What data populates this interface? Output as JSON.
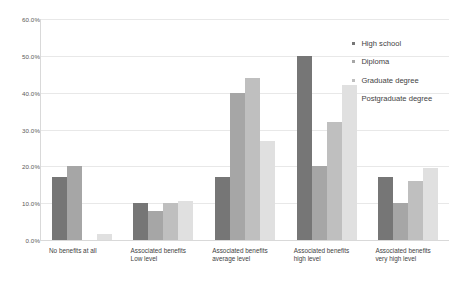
{
  "chart_data": {
    "type": "bar",
    "title": "",
    "xlabel": "",
    "ylabel": "",
    "ylim": [
      0,
      60
    ],
    "grid": true,
    "legend_position": "right",
    "ytick_labels": [
      "60.0%",
      "50.0%",
      "40.0%",
      "30.0%",
      "20.0%",
      "10.0%",
      "0.0%"
    ],
    "ytick_values": [
      60,
      50,
      40,
      30,
      20,
      10,
      0
    ],
    "categories": [
      "No benefits at all",
      "Associated benefits\nLow level",
      "Associated benefits\naverage level",
      "Associated benefits\nhigh level",
      "Associated benefits\nvery high level"
    ],
    "series": [
      {
        "name": "High school",
        "color": "#767676",
        "values": [
          17.0,
          10.0,
          17.0,
          50.0,
          17.0
        ]
      },
      {
        "name": "Diploma",
        "color": "#a6a6a6",
        "values": [
          20.0,
          8.0,
          40.0,
          20.0,
          10.0
        ]
      },
      {
        "name": "Graduate degree",
        "color": "#bfbfbf",
        "values": [
          0.0,
          10.0,
          44.0,
          32.0,
          16.0
        ]
      },
      {
        "name": "Postgraduate degree",
        "color": "#e0e0e0",
        "values": [
          1.5,
          10.5,
          27.0,
          42.0,
          19.5
        ]
      }
    ]
  }
}
